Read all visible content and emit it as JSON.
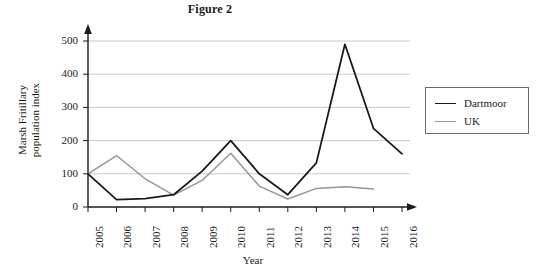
{
  "figure": {
    "title": "Figure 2"
  },
  "axes": {
    "xlabel": "Year",
    "ylabel_line1": "Marsh Fritillary",
    "ylabel_line2": "population index",
    "ytick_labels": [
      "0",
      "100",
      "200",
      "300",
      "400",
      "500"
    ],
    "xtick_labels": [
      "2005",
      "2006",
      "2007",
      "2008",
      "2009",
      "2010",
      "2011",
      "2012",
      "2013",
      "2014",
      "2015",
      "2016"
    ]
  },
  "legend": {
    "entries": [
      {
        "label": "Dartmoor",
        "color": "#1a1a1a"
      },
      {
        "label": "UK",
        "color": "#969696"
      }
    ]
  },
  "colors": {
    "dartmoor": "#1a1a1a",
    "uk": "#969696",
    "gridline": "#c8c8c8",
    "axis": "#1a1a1a",
    "background": "#ffffff"
  },
  "chart_data": {
    "type": "line",
    "title": "Figure 2",
    "xlabel": "Year",
    "ylabel": "Marsh Fritillary population index",
    "x": [
      2005,
      2006,
      2007,
      2008,
      2009,
      2010,
      2011,
      2012,
      2013,
      2014,
      2015,
      2016
    ],
    "categories": [
      "2005",
      "2006",
      "2007",
      "2008",
      "2009",
      "2010",
      "2011",
      "2012",
      "2013",
      "2014",
      "2015",
      "2016"
    ],
    "series": [
      {
        "name": "Dartmoor",
        "color": "#1a1a1a",
        "values": [
          100,
          22,
          25,
          37,
          108,
          200,
          100,
          37,
          133,
          490,
          237,
          160
        ]
      },
      {
        "name": "UK",
        "color": "#969696",
        "values": [
          100,
          155,
          85,
          36,
          80,
          162,
          63,
          24,
          56,
          61,
          54,
          null
        ]
      }
    ],
    "ylim": [
      0,
      520
    ],
    "yticks": [
      0,
      100,
      200,
      300,
      400,
      500
    ],
    "grid": "horizontal",
    "legend_position": "right-outside"
  }
}
